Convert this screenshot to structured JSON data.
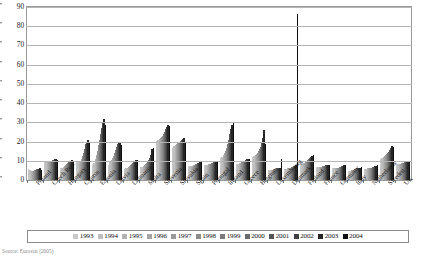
{
  "chart_data": {
    "type": "bar",
    "title": "",
    "subtitle": "",
    "xlabel": "",
    "ylabel": "",
    "ylim": [
      0,
      90
    ],
    "yticks": [
      0,
      10,
      20,
      30,
      40,
      50,
      60,
      70,
      80,
      90
    ],
    "grid": true,
    "legend_position": "bottom",
    "categories": [
      "Poland",
      "Czech Rep.",
      "Hungary",
      "Cyprus",
      "Estonia",
      "Latvia",
      "Lithuania",
      "Malta",
      "Slovenia",
      "Slovakia",
      "Spain",
      "Portugal",
      "Ireland",
      "Greece",
      "Belgium",
      "Luxembourg",
      "Denmark",
      "Finland",
      "France",
      "Germany",
      "Italy",
      "Netherlands",
      "Sweden",
      "UK"
    ],
    "series": [
      {
        "name": "1993",
        "color": "#c9c9c9",
        "values": [
          5.5,
          10.0,
          6.5,
          9.5,
          8.5,
          8.0,
          5.5,
          7.0,
          20.5,
          16.5,
          7.5,
          8.0,
          11.5,
          8.5,
          12.0,
          5.0,
          5.5,
          8.0,
          7.0,
          6.0,
          4.5,
          5.5,
          11.0,
          8.5
        ]
      },
      {
        "name": "1994",
        "color": "#bfbfbf",
        "values": [
          5.0,
          9.5,
          6.5,
          10.0,
          9.0,
          9.5,
          6.0,
          7.0,
          21.0,
          17.5,
          7.5,
          8.0,
          12.0,
          8.5,
          12.5,
          5.0,
          5.5,
          8.5,
          7.0,
          6.0,
          4.5,
          5.5,
          11.5,
          8.5
        ]
      },
      {
        "name": "1995",
        "color": "#b2b2b2",
        "values": [
          4.5,
          9.5,
          7.0,
          10.0,
          11.0,
          10.5,
          6.5,
          7.5,
          21.5,
          18.0,
          7.5,
          8.0,
          13.0,
          9.0,
          13.0,
          5.0,
          6.0,
          9.0,
          7.0,
          6.0,
          5.0,
          6.0,
          12.0,
          8.5
        ]
      },
      {
        "name": "1996",
        "color": "#a5a5a5",
        "values": [
          4.5,
          9.5,
          7.5,
          10.0,
          13.0,
          11.5,
          7.0,
          8.0,
          22.0,
          18.5,
          7.5,
          8.5,
          14.0,
          9.0,
          13.5,
          5.0,
          6.0,
          9.0,
          7.0,
          6.0,
          5.0,
          6.0,
          12.5,
          8.5
        ]
      },
      {
        "name": "1997",
        "color": "#999999",
        "values": [
          4.5,
          9.5,
          8.0,
          11.0,
          15.0,
          12.5,
          7.5,
          8.5,
          22.5,
          19.0,
          8.0,
          8.5,
          15.0,
          9.5,
          14.0,
          5.5,
          6.5,
          9.5,
          7.0,
          6.5,
          5.0,
          6.0,
          13.0,
          9.0
        ]
      },
      {
        "name": "1998",
        "color": "#8c8c8c",
        "values": [
          5.0,
          10.0,
          8.5,
          12.5,
          18.0,
          14.0,
          8.0,
          9.0,
          23.0,
          19.5,
          8.0,
          8.5,
          16.5,
          9.5,
          15.0,
          5.5,
          6.5,
          10.0,
          7.5,
          6.5,
          5.5,
          6.5,
          13.5,
          9.0
        ]
      },
      {
        "name": "1999",
        "color": "#7a7a7a",
        "values": [
          5.0,
          10.0,
          9.0,
          14.0,
          21.0,
          15.5,
          8.5,
          9.5,
          24.0,
          20.0,
          8.5,
          9.0,
          18.5,
          10.0,
          16.0,
          5.5,
          7.0,
          10.5,
          7.5,
          7.0,
          5.5,
          6.5,
          14.0,
          9.0
        ]
      },
      {
        "name": "2000",
        "color": "#6b6b6b",
        "values": [
          5.5,
          10.5,
          9.5,
          16.0,
          24.0,
          17.0,
          9.0,
          10.5,
          25.0,
          20.5,
          8.5,
          9.0,
          21.0,
          10.0,
          17.0,
          6.0,
          7.0,
          11.0,
          7.5,
          7.0,
          6.0,
          7.0,
          14.5,
          9.5
        ]
      },
      {
        "name": "2001",
        "color": "#555555",
        "values": [
          5.5,
          10.5,
          10.0,
          18.5,
          27.0,
          18.5,
          9.5,
          11.5,
          26.5,
          21.0,
          9.0,
          9.5,
          24.0,
          10.5,
          19.0,
          6.0,
          7.5,
          11.5,
          8.0,
          7.5,
          6.0,
          7.0,
          15.5,
          9.5
        ]
      },
      {
        "name": "2002",
        "color": "#3f3f3f",
        "values": [
          5.5,
          11.0,
          10.0,
          20.0,
          29.5,
          19.5,
          10.0,
          13.0,
          27.5,
          21.5,
          9.0,
          9.5,
          26.5,
          11.0,
          22.0,
          6.0,
          7.5,
          12.0,
          8.0,
          7.5,
          6.5,
          7.5,
          16.5,
          10.0
        ]
      },
      {
        "name": "2003",
        "color": "#262626",
        "values": [
          6.0,
          11.0,
          10.5,
          21.0,
          31.5,
          20.0,
          10.5,
          16.0,
          28.5,
          22.0,
          9.5,
          10.0,
          28.5,
          11.0,
          26.0,
          6.5,
          8.0,
          12.5,
          8.0,
          8.0,
          6.5,
          7.5,
          17.5,
          10.0
        ]
      },
      {
        "name": "2004",
        "color": "#0d0d0d",
        "values": [
          5.0,
          10.5,
          10.0,
          20.0,
          28.5,
          18.0,
          10.5,
          16.5,
          28.0,
          19.5,
          9.5,
          10.0,
          29.5,
          11.0,
          18.5,
          11.0,
          86.5,
          13.0,
          8.0,
          8.0,
          7.0,
          8.0,
          17.0,
          10.0
        ]
      }
    ]
  },
  "source": {
    "text": "Source: Eurostat (2005)"
  }
}
